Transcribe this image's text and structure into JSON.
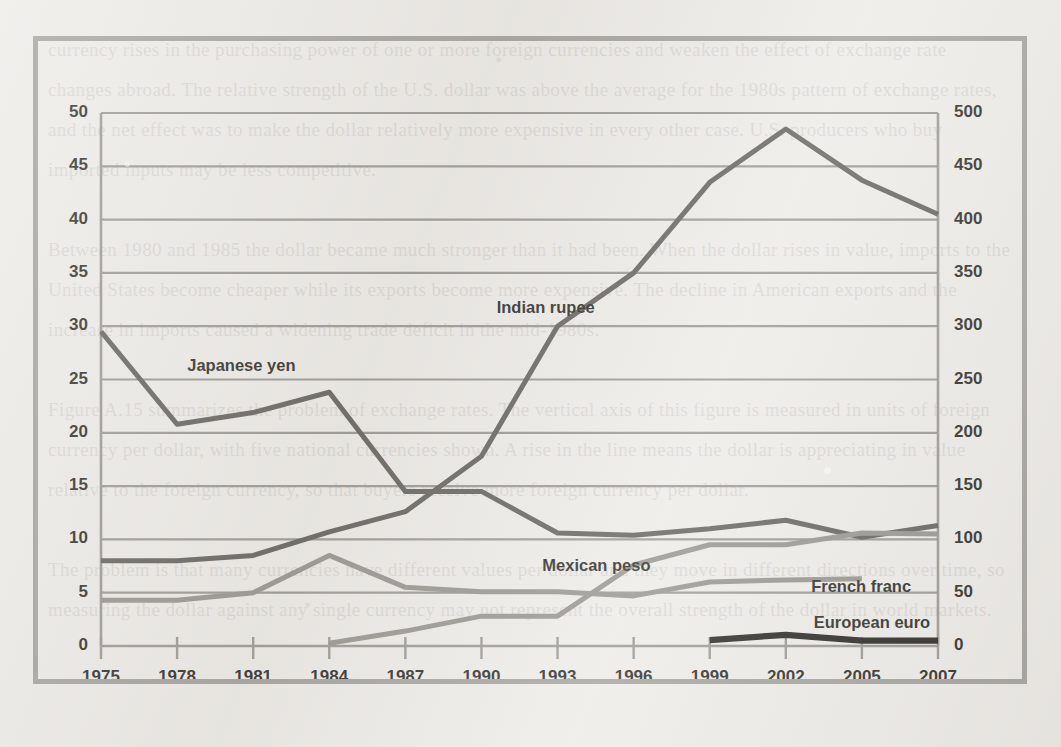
{
  "chart_data": {
    "type": "line",
    "title": "",
    "subtitle": "",
    "xlabel": "",
    "ylabel": "",
    "grid": true,
    "legend_position": "inline-annotations",
    "categories": [
      "1975",
      "1978",
      "1981",
      "1984",
      "1987",
      "1990",
      "1993",
      "1996",
      "1999",
      "2002",
      "2005",
      "2007"
    ],
    "x": [
      1975,
      1978,
      1981,
      1984,
      1987,
      1990,
      1993,
      1996,
      1999,
      2002,
      2005,
      2007
    ],
    "axes": {
      "left": {
        "ticks": [
          0,
          5,
          10,
          15,
          20,
          25,
          30,
          35,
          40,
          45,
          50
        ],
        "ylim": [
          0,
          50
        ],
        "tick_labels": [
          "0",
          "5",
          "10",
          "15",
          "20",
          "25",
          "30",
          "35",
          "40",
          "45",
          "50"
        ]
      },
      "right": {
        "ticks": [
          0,
          50,
          100,
          150,
          200,
          250,
          300,
          350,
          400,
          450,
          500
        ],
        "ylim": [
          0,
          500
        ],
        "tick_labels": [
          "0",
          "50",
          "100",
          "150",
          "200",
          "250",
          "300",
          "350",
          "400",
          "450",
          "500"
        ]
      },
      "x": {
        "tick_labels": [
          "1975",
          "1978",
          "1981",
          "1984",
          "1987",
          "1990",
          "1993",
          "1996",
          "1999",
          "2002",
          "2005",
          "2007"
        ]
      }
    },
    "series": [
      {
        "name": "Japanese yen",
        "axis": "right",
        "color": "#54524d",
        "label_x": 1978.4,
        "label_y": 26.2,
        "x": [
          1975,
          1978,
          1981,
          1984,
          1987,
          1990,
          1993,
          1996,
          1999,
          2002,
          2005,
          2007
        ],
        "values": [
          295,
          208,
          219,
          238,
          145,
          145,
          106,
          104,
          110,
          118,
          102,
          113
        ],
        "values_left_scale": [
          29.5,
          20.8,
          21.9,
          23.8,
          14.5,
          14.5,
          10.6,
          10.4,
          11.0,
          11.8,
          10.2,
          11.3
        ]
      },
      {
        "name": "Indian rupee",
        "axis": "left",
        "color": "#54524d",
        "label_x": 1990.6,
        "label_y": 31.6,
        "x": [
          1975,
          1978,
          1981,
          1984,
          1987,
          1990,
          1993,
          1996,
          1999,
          2002,
          2005,
          2007
        ],
        "values": [
          8.0,
          8.0,
          8.5,
          10.7,
          12.6,
          17.8,
          30.0,
          35.0,
          43.5,
          48.5,
          43.7,
          40.5
        ]
      },
      {
        "name": "Mexican peso",
        "axis": "left",
        "color": "#8b8982",
        "label_x": 1992.4,
        "label_y": 7.4,
        "x": [
          1984,
          1987,
          1990,
          1993,
          1996,
          1999,
          2002,
          2005,
          2007
        ],
        "values": [
          0.25,
          1.4,
          2.8,
          2.8,
          7.6,
          9.5,
          9.5,
          10.6,
          10.5
        ]
      },
      {
        "name": "French franc",
        "axis": "left",
        "color": "#8b8982",
        "label_x": 2003.0,
        "label_y": 5.4,
        "x": [
          1975,
          1978,
          1981,
          1984,
          1987,
          1990,
          1993,
          1996,
          1999,
          2002,
          2005
        ],
        "values": [
          4.3,
          4.3,
          5.0,
          8.5,
          5.5,
          5.1,
          5.1,
          4.7,
          6.0,
          6.2,
          6.3
        ]
      },
      {
        "name": "European euro",
        "axis": "left",
        "color": "#12110d",
        "label_x": 2003.1,
        "label_y": 2.05,
        "x": [
          1999,
          2002,
          2005,
          2007
        ],
        "values": [
          0.55,
          1.05,
          0.5,
          0.5
        ]
      }
    ]
  },
  "bleed_through_text": "currency rises in the purchasing power of one or more foreign currencies and weaken the effect of exchange rate changes abroad. The relative strength of the U.S. dollar was above the average for the 1980s pattern of exchange rates, and the net effect was to make the dollar relatively more expensive in every other case. U.S. producers who buy imported inputs may be less competitive.\n\nBetween 1980 and 1985 the dollar became much stronger than it had been. When the dollar rises in value, imports to the United States become cheaper while its exports become more expensive. The decline in American exports and the increase in imports caused a widening trade deficit in the mid-1980s.\n\nFigure A.15 summarizes the problem of exchange rates. The vertical axis of this figure is measured in units of foreign currency per dollar, with five national currencies shown. A rise in the line means the dollar is appreciating in value relative to the foreign currency, so that buyers receive more foreign currency per dollar.\n\nThe problem is that many currencies have different values per dollar and they move in different directions over time, so measuring the dollar against any single currency may not represent the overall strength of the dollar in world markets."
}
